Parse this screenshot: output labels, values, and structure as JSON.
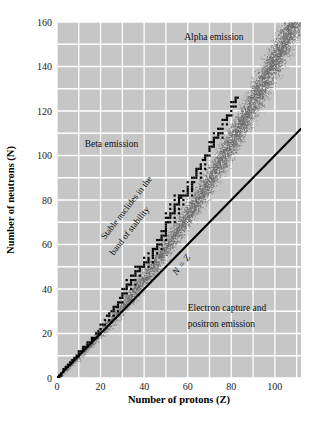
{
  "chart_data": {
    "type": "scatter",
    "title": "",
    "xlabel": "Number of protons (Z)",
    "ylabel": "Number of neutrons (N)",
    "xlim": [
      0,
      112
    ],
    "ylim": [
      0,
      160
    ],
    "xticks": [
      0,
      20,
      40,
      60,
      80,
      100
    ],
    "yticks": [
      0,
      20,
      40,
      60,
      80,
      100,
      120,
      140,
      160
    ],
    "xtick_labels": [
      "0",
      "20",
      "40",
      "60",
      "80",
      "100"
    ],
    "ytick_labels": [
      "0",
      "20",
      "40",
      "60",
      "80",
      "100",
      "120",
      "140",
      "160"
    ],
    "grid": true,
    "grid_spacing": 10,
    "grid_color": "#ffffff",
    "plot_background": "#c6c6c6",
    "legend": "none",
    "annotations": [
      {
        "name": "alpha-emission",
        "text": "Alpha emission",
        "x": 72,
        "y": 152
      },
      {
        "name": "beta-emission",
        "text": "Beta emission",
        "x": 25,
        "y": 104
      },
      {
        "name": "stable-nuclides-line1",
        "text": "Stable nuclides in the",
        "x": 22,
        "y": 62,
        "rotation": -52
      },
      {
        "name": "stable-nuclides-line2",
        "text": "band of stability",
        "x": 26,
        "y": 55,
        "rotation": -52
      },
      {
        "name": "n-equals-z",
        "text": "N = Z",
        "x": 55,
        "y": 46,
        "rotation": -52
      },
      {
        "name": "electron-capture-line1",
        "text": "Electron capture and",
        "x": 60,
        "y": 30
      },
      {
        "name": "electron-capture-line2",
        "text": "positron emission",
        "x": 60,
        "y": 23
      }
    ],
    "series": [
      {
        "name": "N = Z reference line",
        "type": "line",
        "color": "#000000",
        "points": [
          [
            0,
            0
          ],
          [
            112,
            112
          ]
        ]
      },
      {
        "name": "Band of stability (stable nuclides)",
        "type": "scatter",
        "marker": "square",
        "color": "#000000",
        "description": "Staircase of stable nuclide squares curving above the N=Z line",
        "points": [
          [
            1,
            0
          ],
          [
            1,
            1
          ],
          [
            2,
            1
          ],
          [
            2,
            2
          ],
          [
            3,
            3
          ],
          [
            3,
            4
          ],
          [
            4,
            4
          ],
          [
            4,
            5
          ],
          [
            5,
            5
          ],
          [
            5,
            6
          ],
          [
            6,
            6
          ],
          [
            6,
            7
          ],
          [
            7,
            7
          ],
          [
            7,
            8
          ],
          [
            8,
            8
          ],
          [
            8,
            9
          ],
          [
            9,
            10
          ],
          [
            10,
            10
          ],
          [
            10,
            11
          ],
          [
            10,
            12
          ],
          [
            11,
            12
          ],
          [
            12,
            12
          ],
          [
            12,
            13
          ],
          [
            12,
            14
          ],
          [
            13,
            14
          ],
          [
            14,
            14
          ],
          [
            14,
            15
          ],
          [
            14,
            16
          ],
          [
            15,
            16
          ],
          [
            16,
            16
          ],
          [
            16,
            17
          ],
          [
            16,
            18
          ],
          [
            17,
            18
          ],
          [
            18,
            18
          ],
          [
            18,
            20
          ],
          [
            19,
            20
          ],
          [
            19,
            21
          ],
          [
            20,
            20
          ],
          [
            20,
            22
          ],
          [
            20,
            24
          ],
          [
            21,
            24
          ],
          [
            22,
            24
          ],
          [
            22,
            26
          ],
          [
            23,
            28
          ],
          [
            24,
            26
          ],
          [
            24,
            28
          ],
          [
            24,
            29
          ],
          [
            25,
            30
          ],
          [
            26,
            28
          ],
          [
            26,
            30
          ],
          [
            26,
            31
          ],
          [
            26,
            32
          ],
          [
            27,
            32
          ],
          [
            28,
            30
          ],
          [
            28,
            32
          ],
          [
            28,
            33
          ],
          [
            28,
            34
          ],
          [
            29,
            34
          ],
          [
            29,
            36
          ],
          [
            30,
            34
          ],
          [
            30,
            36
          ],
          [
            30,
            37
          ],
          [
            30,
            38
          ],
          [
            30,
            40
          ],
          [
            31,
            38
          ],
          [
            31,
            40
          ],
          [
            32,
            38
          ],
          [
            32,
            40
          ],
          [
            32,
            41
          ],
          [
            32,
            42
          ],
          [
            32,
            44
          ],
          [
            33,
            42
          ],
          [
            34,
            40
          ],
          [
            34,
            42
          ],
          [
            34,
            43
          ],
          [
            34,
            44
          ],
          [
            34,
            46
          ],
          [
            35,
            44
          ],
          [
            35,
            46
          ],
          [
            36,
            42
          ],
          [
            36,
            44
          ],
          [
            36,
            46
          ],
          [
            36,
            47
          ],
          [
            36,
            48
          ],
          [
            36,
            50
          ],
          [
            37,
            48
          ],
          [
            37,
            50
          ],
          [
            38,
            46
          ],
          [
            38,
            48
          ],
          [
            38,
            49
          ],
          [
            38,
            50
          ],
          [
            39,
            50
          ],
          [
            40,
            50
          ],
          [
            40,
            51
          ],
          [
            40,
            52
          ],
          [
            40,
            54
          ],
          [
            41,
            52
          ],
          [
            42,
            50
          ],
          [
            42,
            52
          ],
          [
            42,
            53
          ],
          [
            42,
            54
          ],
          [
            42,
            56
          ],
          [
            44,
            52
          ],
          [
            44,
            54
          ],
          [
            44,
            55
          ],
          [
            44,
            56
          ],
          [
            44,
            57
          ],
          [
            44,
            58
          ],
          [
            45,
            58
          ],
          [
            46,
            56
          ],
          [
            46,
            58
          ],
          [
            46,
            59
          ],
          [
            46,
            60
          ],
          [
            46,
            62
          ],
          [
            47,
            60
          ],
          [
            47,
            62
          ],
          [
            48,
            58
          ],
          [
            48,
            60
          ],
          [
            48,
            62
          ],
          [
            48,
            63
          ],
          [
            48,
            64
          ],
          [
            48,
            66
          ],
          [
            49,
            64
          ],
          [
            49,
            66
          ],
          [
            50,
            62
          ],
          [
            50,
            64
          ],
          [
            50,
            65
          ],
          [
            50,
            66
          ],
          [
            50,
            67
          ],
          [
            50,
            68
          ],
          [
            50,
            69
          ],
          [
            50,
            70
          ],
          [
            50,
            72
          ],
          [
            50,
            74
          ],
          [
            51,
            70
          ],
          [
            51,
            72
          ],
          [
            52,
            70
          ],
          [
            52,
            72
          ],
          [
            52,
            73
          ],
          [
            52,
            74
          ],
          [
            52,
            76
          ],
          [
            52,
            78
          ],
          [
            53,
            74
          ],
          [
            54,
            70
          ],
          [
            54,
            72
          ],
          [
            54,
            74
          ],
          [
            54,
            75
          ],
          [
            54,
            76
          ],
          [
            54,
            77
          ],
          [
            54,
            78
          ],
          [
            54,
            80
          ],
          [
            54,
            82
          ],
          [
            55,
            78
          ],
          [
            56,
            74
          ],
          [
            56,
            76
          ],
          [
            56,
            78
          ],
          [
            56,
            79
          ],
          [
            56,
            80
          ],
          [
            56,
            81
          ],
          [
            56,
            82
          ],
          [
            57,
            81
          ],
          [
            57,
            82
          ],
          [
            58,
            78
          ],
          [
            58,
            80
          ],
          [
            58,
            82
          ],
          [
            58,
            84
          ],
          [
            59,
            82
          ],
          [
            60,
            82
          ],
          [
            60,
            83
          ],
          [
            60,
            84
          ],
          [
            60,
            85
          ],
          [
            60,
            86
          ],
          [
            60,
            88
          ],
          [
            62,
            82
          ],
          [
            62,
            84
          ],
          [
            62,
            85
          ],
          [
            62,
            86
          ],
          [
            62,
            87
          ],
          [
            62,
            88
          ],
          [
            62,
            90
          ],
          [
            63,
            88
          ],
          [
            63,
            90
          ],
          [
            64,
            90
          ],
          [
            64,
            91
          ],
          [
            64,
            92
          ],
          [
            64,
            93
          ],
          [
            64,
            94
          ],
          [
            65,
            94
          ],
          [
            66,
            90
          ],
          [
            66,
            92
          ],
          [
            66,
            94
          ],
          [
            66,
            95
          ],
          [
            66,
            96
          ],
          [
            67,
            98
          ],
          [
            68,
            94
          ],
          [
            68,
            96
          ],
          [
            68,
            98
          ],
          [
            68,
            99
          ],
          [
            68,
            100
          ],
          [
            69,
            100
          ],
          [
            70,
            100
          ],
          [
            70,
            102
          ],
          [
            70,
            103
          ],
          [
            70,
            104
          ],
          [
            70,
            106
          ],
          [
            71,
            104
          ],
          [
            71,
            106
          ],
          [
            72,
            104
          ],
          [
            72,
            105
          ],
          [
            72,
            106
          ],
          [
            72,
            107
          ],
          [
            72,
            108
          ],
          [
            72,
            110
          ],
          [
            73,
            108
          ],
          [
            74,
            108
          ],
          [
            74,
            109
          ],
          [
            74,
            110
          ],
          [
            74,
            112
          ],
          [
            75,
            110
          ],
          [
            75,
            112
          ],
          [
            76,
            108
          ],
          [
            76,
            110
          ],
          [
            76,
            112
          ],
          [
            76,
            114
          ],
          [
            76,
            116
          ],
          [
            77,
            116
          ],
          [
            78,
            114
          ],
          [
            78,
            116
          ],
          [
            78,
            117
          ],
          [
            78,
            118
          ],
          [
            79,
            118
          ],
          [
            80,
            118
          ],
          [
            80,
            120
          ],
          [
            80,
            122
          ],
          [
            80,
            124
          ],
          [
            81,
            122
          ],
          [
            81,
            124
          ],
          [
            82,
            122
          ],
          [
            82,
            124
          ],
          [
            82,
            125
          ],
          [
            82,
            126
          ],
          [
            83,
            126
          ]
        ]
      },
      {
        "name": "Unstable nuclide halo (stippled)",
        "type": "scatter",
        "marker": "dot",
        "color": "#6a6a6a",
        "description": "Dense stipple cloud surrounding the band of stability, widening toward high Z and extending to N=160 at Z=112"
      }
    ]
  },
  "figure": {
    "axis_label_x": "Number of protons (Z)",
    "axis_label_y": "Number of neutrons (N)"
  }
}
